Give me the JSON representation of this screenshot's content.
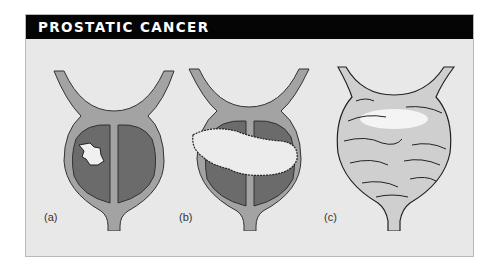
{
  "header": {
    "title": "PROSTATIC CANCER"
  },
  "panels": [
    {
      "label": "(a)",
      "description": "small tumour within one lobe of prostate"
    },
    {
      "label": "(b)",
      "description": "tumour extending across both lobes"
    },
    {
      "label": "(c)",
      "description": "tumour spread throughout entire gland"
    }
  ],
  "colors": {
    "header_bg": "#050505",
    "header_text": "#ffffff",
    "figure_bg": "#e8e8e8",
    "gland_tissue": "#a3a3a3",
    "lobe_fill": "#6b6b6b",
    "tumour": "#f2f2f2"
  }
}
